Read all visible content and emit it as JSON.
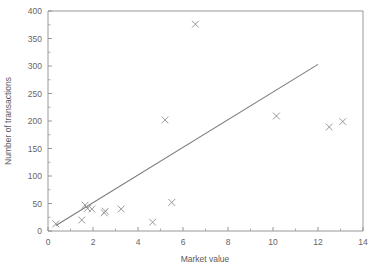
{
  "chart_data": {
    "type": "scatter",
    "title": "",
    "xlabel": "Market value",
    "ylabel": "Number of transactions",
    "xlim": [
      0,
      14
    ],
    "ylim": [
      0,
      400
    ],
    "grid": false,
    "legend": null,
    "x_ticks": [
      0,
      2,
      4,
      6,
      8,
      10,
      12,
      14
    ],
    "x_tick_labels": [
      "0",
      "2",
      "4",
      "6",
      "8",
      "10",
      "12",
      "14"
    ],
    "x_minor_ticks": [
      1,
      3,
      5,
      7,
      9,
      11,
      13
    ],
    "y_ticks": [
      0,
      50,
      100,
      150,
      200,
      250,
      300,
      350,
      400
    ],
    "y_tick_labels": [
      "0",
      "50",
      "100",
      "150",
      "200",
      "250",
      "300",
      "350",
      "400"
    ],
    "marker_symbol": "x",
    "marker_color": "#8f8f8f",
    "line_color": "#7c7c7c",
    "axis_color": "#8c8c8c",
    "background_color": "#ffffff",
    "points": [
      {
        "x": 0.35,
        "y": 13
      },
      {
        "x": 1.5,
        "y": 20
      },
      {
        "x": 1.65,
        "y": 47
      },
      {
        "x": 1.75,
        "y": 41
      },
      {
        "x": 1.95,
        "y": 40
      },
      {
        "x": 2.5,
        "y": 33
      },
      {
        "x": 2.55,
        "y": 36
      },
      {
        "x": 3.25,
        "y": 40
      },
      {
        "x": 4.65,
        "y": 16
      },
      {
        "x": 5.2,
        "y": 202
      },
      {
        "x": 5.5,
        "y": 52
      },
      {
        "x": 6.55,
        "y": 376
      },
      {
        "x": 10.15,
        "y": 209
      },
      {
        "x": 12.5,
        "y": 189
      },
      {
        "x": 13.1,
        "y": 199
      }
    ],
    "fit_line": {
      "name": "regression-line",
      "x_start": 0.35,
      "y_start": 10,
      "x_end": 12.0,
      "y_end": 303
    }
  }
}
